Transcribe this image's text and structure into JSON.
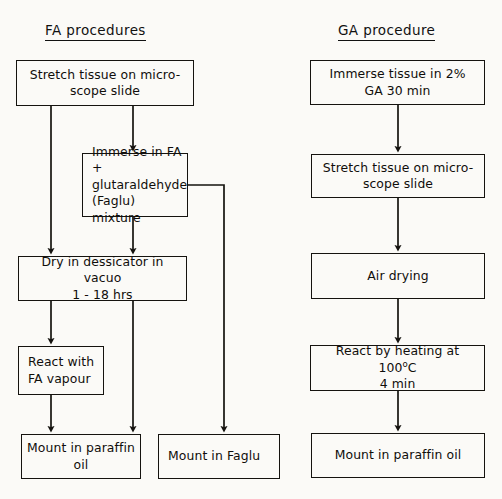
{
  "figure": {
    "title_columns": [
      "FA procedures",
      "GA procedure"
    ],
    "style": {
      "ink": "#15130f",
      "paper": "#fbfaf7"
    }
  },
  "columns": {
    "fa": {
      "heading": "FA procedures",
      "nodes": {
        "stretch": "Stretch tissue on micro-\nscope slide",
        "immerse_faglu": "Immerse in FA +\nglutaraldehyde\n(Faglu) mixture",
        "dry": "Dry in dessicator in vacuo\n1 - 18 hrs",
        "react_vapour": "React with\nFA vapour",
        "mount_paraffin": "Mount in paraffin\noil",
        "mount_faglu": "Mount in Faglu"
      }
    },
    "ga": {
      "heading": "GA procedure",
      "nodes": {
        "immerse_ga": "Immerse tissue in 2%\nGA 30 min",
        "stretch": "Stretch tissue on micro-\nscope slide",
        "air_drying": "Air drying",
        "react_heat_line1_pre": "React by heating at 100",
        "react_heat_degree": "o",
        "react_heat_line1_post": "C",
        "react_heat_line2": "4 min",
        "mount_paraffin": "Mount in paraffin oil"
      }
    }
  },
  "edges": [
    {
      "name": "fa-stretch-to-dry",
      "from": "stretch",
      "to": "dry"
    },
    {
      "name": "fa-stretch-to-immerse",
      "from": "stretch",
      "to": "immerse_faglu"
    },
    {
      "name": "fa-immerse-to-dry",
      "from": "immerse_faglu",
      "to": "dry"
    },
    {
      "name": "fa-immerse-to-mount-faglu",
      "from": "immerse_faglu",
      "to": "mount_faglu"
    },
    {
      "name": "fa-dry-to-react",
      "from": "dry",
      "to": "react_vapour"
    },
    {
      "name": "fa-dry-to-mount-paraffin",
      "from": "dry",
      "to": "mount_paraffin"
    },
    {
      "name": "fa-react-to-mount-paraffin",
      "from": "react_vapour",
      "to": "mount_paraffin"
    },
    {
      "name": "ga-immerse-to-stretch",
      "from": "immerse_ga",
      "to": "stretch"
    },
    {
      "name": "ga-stretch-to-airdry",
      "from": "stretch",
      "to": "air_drying"
    },
    {
      "name": "ga-airdry-to-react",
      "from": "air_drying",
      "to": "react_heat"
    },
    {
      "name": "ga-react-to-mount",
      "from": "react_heat",
      "to": "mount_paraffin"
    }
  ]
}
